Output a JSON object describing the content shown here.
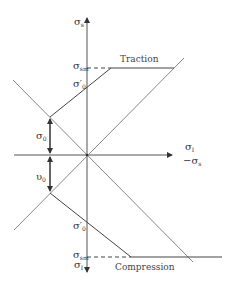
{
  "diagram": {
    "axes": {
      "vertical_top_label": {
        "symbol": "σ",
        "sub": "s"
      },
      "vertical_bottom_label": {
        "symbol": "σ",
        "sub": "I"
      },
      "horizontal_label_top": {
        "symbol": "σ",
        "sub": "I"
      },
      "horizontal_label_bottom": {
        "prefix": "−",
        "symbol": "σ",
        "sub": "s"
      }
    },
    "labels": {
      "traction": "Traction",
      "compression": "Compression",
      "sigma_sm_top": {
        "symbol": "σ",
        "sub": "sm"
      },
      "sigma0_prime_top": {
        "symbol": "σ′",
        "sub": "0"
      },
      "sigma0": {
        "symbol": "σ",
        "sub": "0"
      },
      "upsilon0": {
        "symbol": "υ",
        "sub": "0"
      },
      "sigma0_prime_bottom": {
        "symbol": "σ′",
        "sub": "0"
      },
      "sigma_sm_bottom": {
        "symbol": "σ",
        "sub": "sm"
      }
    },
    "colors": {
      "axis": "#555555",
      "envelope": "#444444",
      "diagonal": "#888888",
      "text": "#333333"
    }
  }
}
